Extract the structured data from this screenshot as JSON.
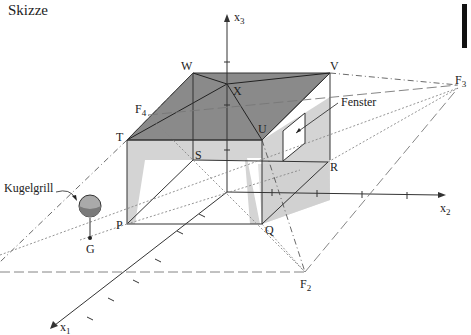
{
  "title": "Skizze",
  "axes": {
    "x1": "x",
    "x1_sub": "1",
    "x2": "x",
    "x2_sub": "2",
    "x3": "x",
    "x3_sub": "3"
  },
  "points": {
    "P": "P",
    "Q": "Q",
    "R": "R",
    "S": "S",
    "T": "T",
    "U": "U",
    "V": "V",
    "W": "W",
    "X": "X",
    "G": "G",
    "F2": "F",
    "F2_sub": "2",
    "F3": "F",
    "F3_sub": "3",
    "F4": "F",
    "F4_sub": "4"
  },
  "annotations": {
    "fenster": "Fenster",
    "kugelgrill": "Kugelgrill"
  },
  "colors": {
    "roof": "#8a8a8a",
    "wall_light": "#d4d4d4",
    "line": "#333333"
  }
}
